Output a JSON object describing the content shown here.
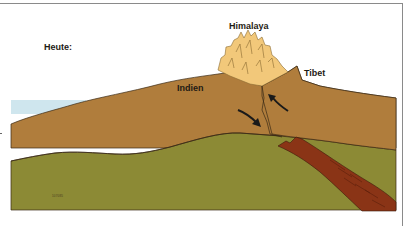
{
  "diagram": {
    "title": "Heute:",
    "labels": {
      "himalaya": "Himalaya",
      "tibet": "Tibet",
      "indien": "Indien"
    },
    "credit": "107085",
    "colors": {
      "sea": "#cfe6ee",
      "crust_brown": "#b07d3c",
      "mountain_light": "#f2c87a",
      "mantle_green": "#8c8a35",
      "subducting_slab": "#8a3416",
      "outline": "#3a2a16",
      "arrow": "#1a1a1a",
      "frame": "#8a8a8a"
    },
    "arrows": [
      {
        "name": "india-push-arrow",
        "direction": "down-right"
      },
      {
        "name": "tibet-push-arrow",
        "direction": "up-left"
      }
    ]
  }
}
